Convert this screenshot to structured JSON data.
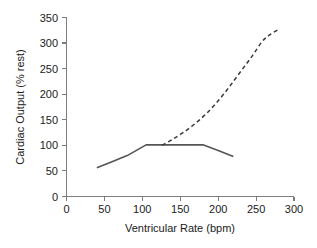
{
  "chart_data": {
    "type": "line",
    "title": "",
    "subtitle": "",
    "xlabel": "Ventricular Rate (bpm)",
    "ylabel": "Cardiac Output (% rest)",
    "xlim": [
      0,
      300
    ],
    "ylim": [
      0,
      350
    ],
    "xticks": [
      0,
      50,
      100,
      150,
      200,
      250,
      300
    ],
    "yticks": [
      0,
      50,
      100,
      150,
      200,
      250,
      300,
      350
    ],
    "xtick_labels": [
      "0",
      "50",
      "100",
      "150",
      "200",
      "250",
      "300"
    ],
    "ytick_labels": [
      "0",
      "50",
      "100",
      "150",
      "200",
      "250",
      "300",
      "350"
    ],
    "grid": false,
    "legend": null,
    "legend_position": "none",
    "annotations": [],
    "series": [
      {
        "name": "Fixed rate pacing (solid)",
        "style": "solid",
        "color": "#555555",
        "x": [
          40,
          60,
          80,
          105,
          130,
          155,
          180,
          200,
          220
        ],
        "y": [
          56,
          68,
          80,
          101,
          101,
          101,
          101,
          90,
          78
        ]
      },
      {
        "name": "Rate-responsive / exercise (dashed)",
        "style": "dashed",
        "color": "#3a3a3a",
        "x": [
          126,
          140,
          155,
          170,
          185,
          200,
          215,
          230,
          245,
          258,
          268,
          280
        ],
        "y": [
          100,
          112,
          126,
          143,
          163,
          187,
          215,
          245,
          275,
          303,
          316,
          327
        ]
      }
    ]
  },
  "axes": {
    "x_title": "Ventricular Rate (bpm)",
    "y_title": "Cardiac Output (% rest)"
  }
}
